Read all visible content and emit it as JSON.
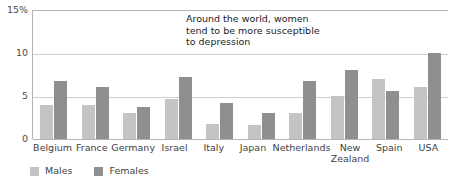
{
  "chart_data": {
    "type": "bar",
    "title": "",
    "subtitle": "",
    "xlabel": "",
    "ylabel": "",
    "ylim": [
      0,
      15
    ],
    "yticks": [
      "0",
      "5",
      "10",
      "15%"
    ],
    "ytick_values": [
      0,
      5,
      10,
      15
    ],
    "grid": true,
    "legend_position": "bottom-left",
    "annotation": "Around the world, women\ntend to be more susceptible\nto depression",
    "categories": [
      "Belgium",
      "France",
      "Germany",
      "Israel",
      "Italy",
      "Japan",
      "Netherlands",
      "New Zealand",
      "Spain",
      "USA"
    ],
    "series": [
      {
        "name": "Males",
        "color": "#c4c4c4",
        "values": [
          4.0,
          4.0,
          3.0,
          4.7,
          1.8,
          1.6,
          3.0,
          5.0,
          7.0,
          6.1
        ]
      },
      {
        "name": "Females",
        "color": "#8f8f8f",
        "values": [
          6.7,
          6.0,
          3.7,
          7.2,
          4.2,
          3.0,
          6.7,
          8.0,
          5.6,
          10.0
        ]
      }
    ]
  },
  "legend": {
    "items": [
      {
        "label": "Males",
        "swatch": "males-swatch"
      },
      {
        "label": "Females",
        "swatch": "females-swatch"
      }
    ]
  },
  "colors": {
    "males": "#c4c4c4",
    "females": "#8f8f8f",
    "gridline": "#cfcfcf",
    "axis": "#b5b5b5",
    "text": "#3f3f3f",
    "annotation_text": "#1d1d1d",
    "background": "#ffffff"
  }
}
